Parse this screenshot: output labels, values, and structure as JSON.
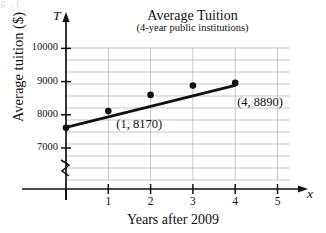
{
  "page": {
    "bleed_top_text": "g                        ,                        ("
  },
  "chart_data": {
    "type": "scatter",
    "title": "Average Tuition",
    "subtitle": "(4-year public institutions)",
    "xlabel": "Years after 2009",
    "ylabel": "Average tuition ($)",
    "x_axis_letter": "x",
    "y_axis_letter": "T",
    "grid": true,
    "axis_break": true,
    "xlim": [
      0,
      5.6
    ],
    "ylim": [
      6500,
      10500
    ],
    "xticks": [
      1,
      2,
      3,
      4,
      5
    ],
    "xtick_labels": [
      "1",
      "2",
      "3",
      "4",
      "5"
    ],
    "yticks": [
      7000,
      8000,
      9000,
      10000
    ],
    "ytick_labels": [
      "7000",
      "8000",
      "9000",
      "10000"
    ],
    "gridlines_y": [
      6700,
      7000,
      7350,
      7700,
      8000,
      8350,
      8700,
      9000,
      9350,
      9700,
      10000
    ],
    "x": [
      0,
      1,
      2,
      3,
      4
    ],
    "values": [
      7610,
      8110,
      8600,
      8880,
      8960
    ],
    "trend_line": {
      "name": "line of best fit",
      "x_start": 0,
      "y_start": 7620,
      "x_end": 4,
      "y_end": 8890
    },
    "annotations": [
      {
        "text": "(1, 8170)",
        "x": 1,
        "y": 8170
      },
      {
        "text": "(4, 8890)",
        "x": 4,
        "y": 8890
      }
    ]
  },
  "colors": {
    "ink": "#111111",
    "grid": "#b9b9b9",
    "marker": "#111111"
  }
}
